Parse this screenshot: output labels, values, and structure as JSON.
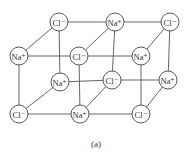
{
  "diagram": {
    "caption": "(a)",
    "atoms": [
      {
        "id": "bt0",
        "label": "Cl⁻",
        "ion": "Cl-",
        "x": 59,
        "y": 22
      },
      {
        "id": "bt1",
        "label": "Na⁺",
        "ion": "Na+",
        "x": 115,
        "y": 22
      },
      {
        "id": "bt2",
        "label": "Cl⁻",
        "ion": "Cl-",
        "x": 170,
        "y": 22
      },
      {
        "id": "ft0",
        "label": "Na⁺",
        "ion": "Na+",
        "x": 19,
        "y": 56
      },
      {
        "id": "ft1",
        "label": "Cl⁻",
        "ion": "Cl-",
        "x": 79,
        "y": 56
      },
      {
        "id": "ft2",
        "label": "Na⁺",
        "ion": "Na+",
        "x": 141,
        "y": 56
      },
      {
        "id": "bb0",
        "label": "Na⁺",
        "ion": "Na+",
        "x": 60,
        "y": 82
      },
      {
        "id": "bb1",
        "label": "Cl⁻",
        "ion": "Cl-",
        "x": 112,
        "y": 80
      },
      {
        "id": "bb2",
        "label": "Na⁺",
        "ion": "Na+",
        "x": 168,
        "y": 80
      },
      {
        "id": "fb0",
        "label": "Cl⁻",
        "ion": "Cl-",
        "x": 19,
        "y": 114
      },
      {
        "id": "fb1",
        "label": "Na⁺",
        "ion": "Na+",
        "x": 80,
        "y": 114
      },
      {
        "id": "fb2",
        "label": "Cl⁻",
        "ion": "Cl-",
        "x": 141,
        "y": 114
      }
    ],
    "bonds": [
      [
        "bt0",
        "bt1"
      ],
      [
        "bt1",
        "bt2"
      ],
      [
        "ft0",
        "ft1"
      ],
      [
        "ft1",
        "ft2"
      ],
      [
        "bb0",
        "bb1"
      ],
      [
        "bb1",
        "bb2"
      ],
      [
        "fb0",
        "fb1"
      ],
      [
        "fb1",
        "fb2"
      ],
      [
        "bt0",
        "ft0"
      ],
      [
        "bt1",
        "ft1"
      ],
      [
        "bt2",
        "ft2"
      ],
      [
        "bb0",
        "fb0"
      ],
      [
        "bb1",
        "fb1"
      ],
      [
        "bb2",
        "fb2"
      ],
      [
        "bt0",
        "bb0"
      ],
      [
        "bt1",
        "bb1"
      ],
      [
        "bt2",
        "bb2"
      ],
      [
        "ft0",
        "fb0"
      ],
      [
        "ft1",
        "fb1"
      ],
      [
        "ft2",
        "fb2"
      ]
    ]
  }
}
